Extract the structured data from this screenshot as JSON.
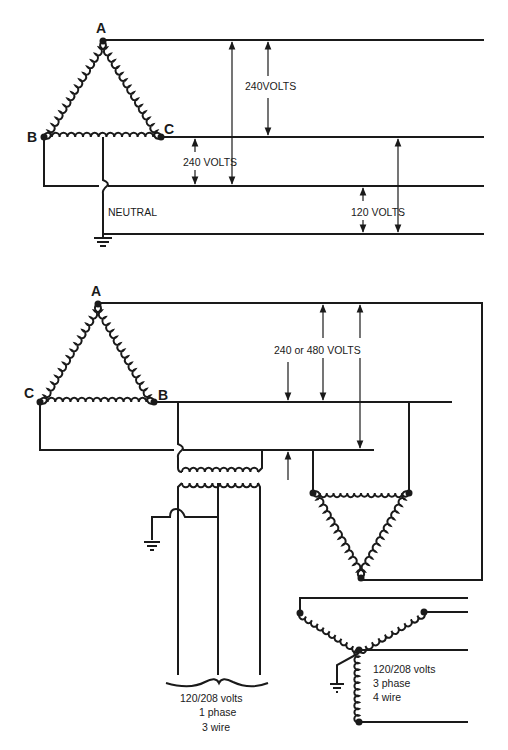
{
  "top_diagram": {
    "title": "Delta transformer, 4-wire (240/120 V)",
    "nodes": {
      "a": "A",
      "b": "B",
      "c": "C"
    },
    "neutral_label": "NEUTRAL",
    "voltage_labels": {
      "a_to_b": "240 VOLTS",
      "a_to_c": "240VOLTS",
      "c_to_b": "240 VOLTS",
      "to_neutral": "120 VOLTS"
    }
  },
  "bottom_diagram": {
    "nodes": {
      "a": "A",
      "b": "B",
      "c": "C"
    },
    "line_voltage_label": "240 or 480 VOLTS",
    "single_phase": {
      "line1": "120/208 volts",
      "line2": "1 phase",
      "line3": "3 wire"
    },
    "three_phase": {
      "line1": "120/208 volts",
      "line2": "3 phase",
      "line3": "4 wire"
    }
  },
  "colors": {
    "ink": "#1a1a1a",
    "background": "#ffffff"
  }
}
